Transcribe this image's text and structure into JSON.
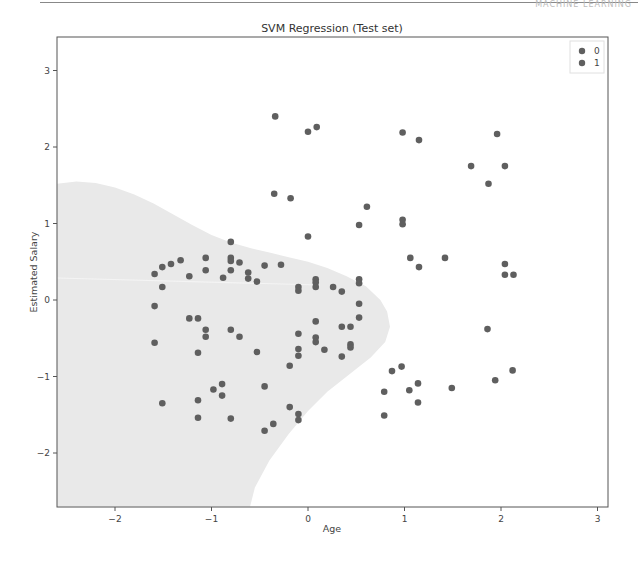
{
  "page_header": {
    "text": "MACHINE LEARNING"
  },
  "chart_data": {
    "type": "scatter",
    "title": "SVM Regression (Test set)",
    "xlabel": "Age",
    "ylabel": "Estimated Salary",
    "xlim": [
      -2.6,
      3.1
    ],
    "ylim": [
      -2.7,
      3.45
    ],
    "xticks": [
      -2,
      -1,
      0,
      1,
      2,
      3
    ],
    "yticks": [
      -2,
      -1,
      0,
      1,
      2,
      3
    ],
    "grid": false,
    "legend": {
      "position": "upper right",
      "entries": [
        "0",
        "1"
      ]
    },
    "colors": {
      "point": "#5f5f5f",
      "region_fill": "#e9e9e9",
      "region_other": "#ffffff",
      "axes": "#444444"
    },
    "decision_region_class0_boundary": [
      [
        -2.6,
        1.52
      ],
      [
        -2.4,
        1.55
      ],
      [
        -2.2,
        1.53
      ],
      [
        -2.0,
        1.47
      ],
      [
        -1.8,
        1.38
      ],
      [
        -1.6,
        1.26
      ],
      [
        -1.4,
        1.12
      ],
      [
        -1.2,
        0.98
      ],
      [
        -1.0,
        0.85
      ],
      [
        -0.8,
        0.75
      ],
      [
        -0.6,
        0.68
      ],
      [
        -0.4,
        0.62
      ],
      [
        -0.2,
        0.56
      ],
      [
        0.0,
        0.5
      ],
      [
        0.2,
        0.42
      ],
      [
        0.4,
        0.31
      ],
      [
        0.6,
        0.18
      ],
      [
        0.75,
        0.0
      ],
      [
        0.82,
        -0.15
      ],
      [
        0.85,
        -0.35
      ],
      [
        0.8,
        -0.55
      ],
      [
        0.65,
        -0.75
      ],
      [
        0.45,
        -0.95
      ],
      [
        0.2,
        -1.2
      ],
      [
        0.0,
        -1.45
      ],
      [
        -0.2,
        -1.75
      ],
      [
        -0.4,
        -2.1
      ],
      [
        -0.55,
        -2.45
      ],
      [
        -0.6,
        -2.7
      ],
      [
        -2.6,
        -2.7
      ]
    ],
    "series": [
      {
        "name": "0",
        "points": [
          [
            -1.59,
            0.34
          ],
          [
            -1.51,
            0.43
          ],
          [
            -1.42,
            0.47
          ],
          [
            -1.32,
            0.52
          ],
          [
            -1.51,
            0.17
          ],
          [
            -1.59,
            -0.08
          ],
          [
            -1.59,
            -0.56
          ],
          [
            -1.51,
            -1.35
          ],
          [
            -1.23,
            0.31
          ],
          [
            -1.06,
            0.55
          ],
          [
            -1.06,
            0.39
          ],
          [
            -0.8,
            0.76
          ],
          [
            -0.8,
            0.55
          ],
          [
            -0.8,
            0.51
          ],
          [
            -0.8,
            0.39
          ],
          [
            -0.71,
            0.49
          ],
          [
            -0.62,
            0.36
          ],
          [
            -0.62,
            0.28
          ],
          [
            -0.88,
            0.29
          ],
          [
            -0.53,
            0.24
          ],
          [
            -0.45,
            0.45
          ],
          [
            -0.28,
            0.46
          ],
          [
            -1.23,
            -0.24
          ],
          [
            -1.14,
            -0.24
          ],
          [
            -1.06,
            -0.39
          ],
          [
            -1.06,
            -0.48
          ],
          [
            -0.8,
            -0.39
          ],
          [
            -0.71,
            -0.48
          ],
          [
            -0.53,
            -0.68
          ],
          [
            -1.14,
            -0.69
          ],
          [
            -1.14,
            -1.31
          ],
          [
            -1.14,
            -1.54
          ],
          [
            -0.98,
            -1.17
          ],
          [
            -0.89,
            -1.1
          ],
          [
            -0.89,
            -1.25
          ],
          [
            -0.8,
            -1.55
          ],
          [
            -0.45,
            -1.13
          ],
          [
            -0.45,
            -1.71
          ],
          [
            -0.36,
            -1.62
          ],
          [
            -0.19,
            -0.86
          ],
          [
            -0.19,
            -1.4
          ],
          [
            -0.1,
            -1.49
          ],
          [
            -0.1,
            -1.57
          ],
          [
            -0.1,
            0.17
          ],
          [
            -0.1,
            0.12
          ],
          [
            0.08,
            0.27
          ],
          [
            0.08,
            0.23
          ],
          [
            0.08,
            0.17
          ],
          [
            0.26,
            0.17
          ],
          [
            0.35,
            0.11
          ],
          [
            0.53,
            0.27
          ],
          [
            0.53,
            0.22
          ],
          [
            0.53,
            -0.05
          ],
          [
            0.53,
            -0.23
          ],
          [
            0.08,
            -0.28
          ],
          [
            0.35,
            -0.35
          ],
          [
            0.44,
            -0.35
          ],
          [
            -0.1,
            -0.44
          ],
          [
            0.08,
            -0.49
          ],
          [
            0.08,
            -0.55
          ],
          [
            0.44,
            -0.58
          ],
          [
            0.44,
            -0.62
          ],
          [
            0.17,
            -0.65
          ],
          [
            -0.1,
            -0.64
          ],
          [
            -0.1,
            -0.73
          ],
          [
            0.35,
            -0.74
          ]
        ]
      },
      {
        "name": "1",
        "points": [
          [
            -0.34,
            2.4
          ],
          [
            0.0,
            2.2
          ],
          [
            0.09,
            2.26
          ],
          [
            0.98,
            2.19
          ],
          [
            1.15,
            2.09
          ],
          [
            1.96,
            2.17
          ],
          [
            -0.35,
            1.39
          ],
          [
            -0.18,
            1.33
          ],
          [
            0.61,
            1.22
          ],
          [
            0.53,
            0.98
          ],
          [
            0.98,
            1.05
          ],
          [
            0.98,
            0.99
          ],
          [
            1.69,
            1.75
          ],
          [
            1.87,
            1.52
          ],
          [
            2.04,
            1.75
          ],
          [
            0.0,
            0.83
          ],
          [
            1.06,
            0.55
          ],
          [
            1.15,
            0.43
          ],
          [
            1.42,
            0.55
          ],
          [
            2.04,
            0.47
          ],
          [
            2.04,
            0.33
          ],
          [
            2.13,
            0.33
          ],
          [
            1.86,
            -0.38
          ],
          [
            0.87,
            -0.93
          ],
          [
            0.97,
            -0.87
          ],
          [
            0.79,
            -1.2
          ],
          [
            1.05,
            -1.18
          ],
          [
            1.14,
            -1.09
          ],
          [
            1.49,
            -1.15
          ],
          [
            1.14,
            -1.34
          ],
          [
            0.79,
            -1.51
          ],
          [
            1.94,
            -1.05
          ],
          [
            2.12,
            -0.92
          ]
        ]
      }
    ]
  }
}
